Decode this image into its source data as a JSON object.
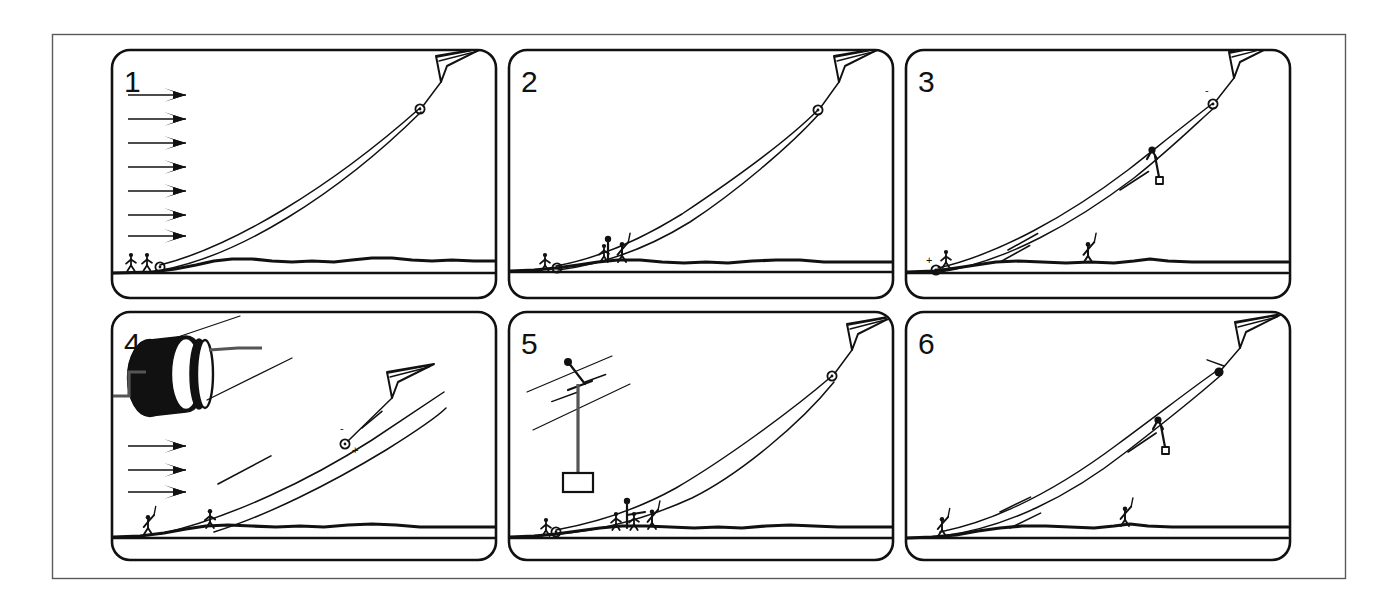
{
  "figure": {
    "outer_border_color": "#5a5a5a",
    "ink_color": "#111111",
    "background_color": "#ffffff",
    "panel_count": 6,
    "columns": 3,
    "rows": 2
  },
  "panels": [
    {
      "number": "1",
      "caption_number": "1",
      "elements": {
        "wind_arrow_count": 7,
        "kite": "delta-kite",
        "line_count": 2,
        "ground_figures": 2,
        "pulley_markers": 2,
        "winch": false,
        "payload": false,
        "direction_arrows": 0
      }
    },
    {
      "number": "2",
      "caption_number": "2",
      "elements": {
        "wind_arrow_count": 0,
        "kite": "delta-kite",
        "line_count": 2,
        "ground_figures": 3,
        "pulley_markers": 2,
        "winch": false,
        "payload": false,
        "direction_arrows": 0
      }
    },
    {
      "number": "3",
      "caption_number": "3",
      "elements": {
        "wind_arrow_count": 0,
        "kite": "delta-kite",
        "line_count": 2,
        "ground_figures": 2,
        "pulley_markers": 2,
        "winch": false,
        "payload": true,
        "direction_arrows": 2
      }
    },
    {
      "number": "4",
      "caption_number": "4",
      "elements": {
        "wind_arrow_count": 3,
        "kite": "delta-kite",
        "line_count": 2,
        "ground_figures": 2,
        "pulley_markers": 1,
        "winch": true,
        "payload": false,
        "direction_arrows": 2
      }
    },
    {
      "number": "5",
      "caption_number": "5",
      "elements": {
        "wind_arrow_count": 0,
        "kite": "delta-kite",
        "line_count": 2,
        "ground_figures": 4,
        "pulley_markers": 2,
        "winch": false,
        "payload": true,
        "direction_arrows": 2,
        "detail_inset": "trolley-with-suspended-load"
      }
    },
    {
      "number": "6",
      "caption_number": "6",
      "elements": {
        "wind_arrow_count": 0,
        "kite": "delta-kite",
        "line_count": 2,
        "ground_figures": 2,
        "pulley_markers": 1,
        "winch": false,
        "payload": true,
        "direction_arrows": 3
      }
    }
  ],
  "annotations": {
    "polarity_plus": "+",
    "polarity_minus": "-"
  }
}
